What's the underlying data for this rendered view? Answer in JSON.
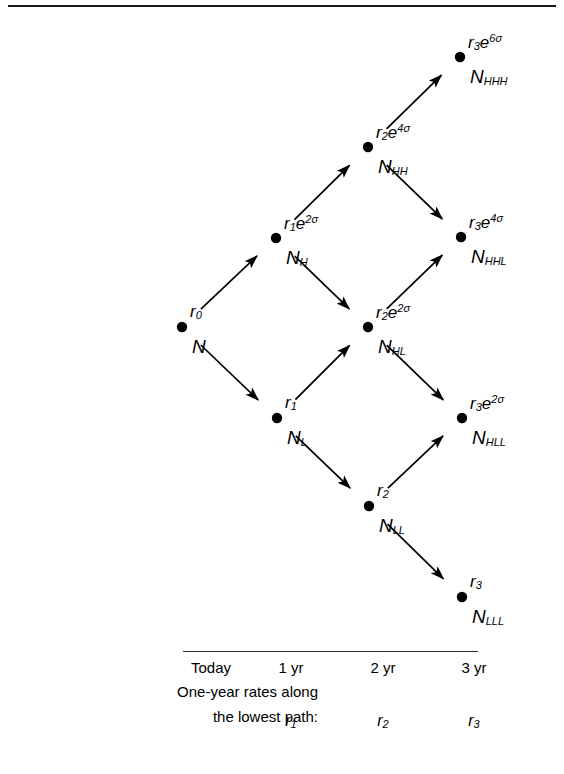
{
  "figure": {
    "title_rule": "top-border",
    "colors": {
      "ink": "#000000",
      "rule": "#1a1a1a"
    }
  },
  "tree": {
    "nodes": [
      {
        "id": "N",
        "cx": 182,
        "cy": 327,
        "rate_label": "r0",
        "state_label": "N",
        "rate_html": "r<sub>0</sub>",
        "state_html": "N"
      },
      {
        "id": "NH",
        "cx": 276,
        "cy": 238,
        "rate_label": "r1e2sigma",
        "state_label": "NH",
        "rate_html": "r<sub>1</sub>e<sup>2σ</sup>",
        "state_html": "N<sub>H</sub>"
      },
      {
        "id": "NL",
        "cx": 277,
        "cy": 418,
        "rate_label": "r1",
        "state_label": "NL",
        "rate_html": "r<sub>1</sub>",
        "state_html": "N<sub>L</sub>"
      },
      {
        "id": "NHH",
        "cx": 368,
        "cy": 147,
        "rate_label": "r2e4sigma",
        "state_label": "NHH",
        "rate_html": "r<sub>2</sub>e<sup>4σ</sup>",
        "state_html": "N<sub>HH</sub>"
      },
      {
        "id": "NHL",
        "cx": 368,
        "cy": 327,
        "rate_label": "r2e2sigma",
        "state_label": "NHL",
        "rate_html": "r<sub>2</sub>e<sup>2σ</sup>",
        "state_html": "N<sub>HL</sub>"
      },
      {
        "id": "NLL",
        "cx": 369,
        "cy": 506,
        "rate_label": "r2",
        "state_label": "NLL",
        "rate_html": "r<sub>2</sub>",
        "state_html": "N<sub>LL</sub>"
      },
      {
        "id": "NHHH",
        "cx": 460,
        "cy": 57,
        "rate_label": "r3e6sigma",
        "state_label": "NHHH",
        "rate_html": "r<sub>3</sub>e<sup>6σ</sup>",
        "state_html": "N<sub>HHH</sub>"
      },
      {
        "id": "NHHL",
        "cx": 461,
        "cy": 237,
        "rate_label": "r3e4sigma",
        "state_label": "NHHL",
        "rate_html": "r<sub>3</sub>e<sup>4σ</sup>",
        "state_html": "N<sub>HHL</sub>"
      },
      {
        "id": "NHLL",
        "cx": 462,
        "cy": 418,
        "rate_label": "r3e2sigma",
        "state_label": "NHLL",
        "rate_html": "r<sub>3</sub>e<sup>2σ</sup>",
        "state_html": "N<sub>HLL</sub>"
      },
      {
        "id": "NLLL",
        "cx": 462,
        "cy": 597,
        "rate_label": "r3",
        "state_label": "NLLL",
        "rate_html": "r<sub>3</sub>",
        "state_html": "N<sub>LLL</sub>"
      }
    ],
    "edges": [
      {
        "from": "N",
        "to": "NH",
        "direction": "up"
      },
      {
        "from": "N",
        "to": "NL",
        "direction": "down"
      },
      {
        "from": "NH",
        "to": "NHH",
        "direction": "up"
      },
      {
        "from": "NH",
        "to": "NHL",
        "direction": "down"
      },
      {
        "from": "NL",
        "to": "NHL",
        "direction": "up"
      },
      {
        "from": "NL",
        "to": "NLL",
        "direction": "down"
      },
      {
        "from": "NHH",
        "to": "NHHH",
        "direction": "up"
      },
      {
        "from": "NHH",
        "to": "NHHL",
        "direction": "down"
      },
      {
        "from": "NHL",
        "to": "NHHL",
        "direction": "up"
      },
      {
        "from": "NHL",
        "to": "NHLL",
        "direction": "down"
      },
      {
        "from": "NLL",
        "to": "NHLL",
        "direction": "up"
      },
      {
        "from": "NLL",
        "to": "NLLL",
        "direction": "down"
      }
    ]
  },
  "timeline": {
    "columns": [
      {
        "label": "Today",
        "x": 211
      },
      {
        "label": "1 yr",
        "x": 291
      },
      {
        "label": "2 yr",
        "x": 383
      },
      {
        "label": "3 yr",
        "x": 474
      }
    ],
    "caption_line_1": "One-year rates along",
    "caption_line_2": "the lowest path:",
    "rate_cells": [
      {
        "html": "r<sub>1</sub>",
        "text": "r1",
        "x": 291
      },
      {
        "html": "r<sub>2</sub>",
        "text": "r2",
        "x": 383
      },
      {
        "html": "r<sub>3</sub>",
        "text": "r3",
        "x": 474
      }
    ]
  }
}
